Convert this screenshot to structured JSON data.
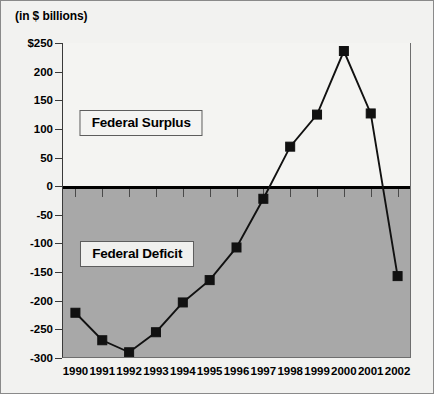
{
  "figure": {
    "units_label": "(in $ billions)"
  },
  "chart_data": {
    "type": "line",
    "title": "",
    "subtitle": "",
    "xlabel": "",
    "ylabel": "(in $ billions)",
    "categories": [
      "1990",
      "1991",
      "1992",
      "1993",
      "1994",
      "1995",
      "1996",
      "1997",
      "1998",
      "1999",
      "2000",
      "2001",
      "2002"
    ],
    "values": [
      -221,
      -269,
      -290,
      -255,
      -203,
      -164,
      -107,
      -22,
      69,
      125,
      236,
      127,
      -157
    ],
    "series": [
      {
        "name": "Federal Surplus/Deficit",
        "values": [
          -221,
          -269,
          -290,
          -255,
          -203,
          -164,
          -107,
          -22,
          69,
          125,
          236,
          127,
          -157
        ]
      }
    ],
    "ylim": [
      -300,
      250
    ],
    "ytick_values": [
      250,
      200,
      150,
      100,
      50,
      0,
      -50,
      -100,
      -150,
      -200,
      -250,
      -300
    ],
    "ytick_labels": [
      "$250",
      "200",
      "150",
      "100",
      "50",
      "0",
      "-50",
      "-100",
      "-150",
      "-200",
      "-250",
      "-300"
    ],
    "grid": false,
    "legend": "none",
    "marker": "square",
    "line_color": "#111111",
    "marker_color": "#111111",
    "positive_region_color": "#f4f4f2",
    "negative_region_color": "#a8a8a8",
    "annotations": [
      {
        "text": "Federal Surplus",
        "x_value": 1992.45,
        "y_value": 110
      },
      {
        "text": "Federal Deficit",
        "x_value": 1992.3,
        "y_value": -118
      }
    ]
  }
}
